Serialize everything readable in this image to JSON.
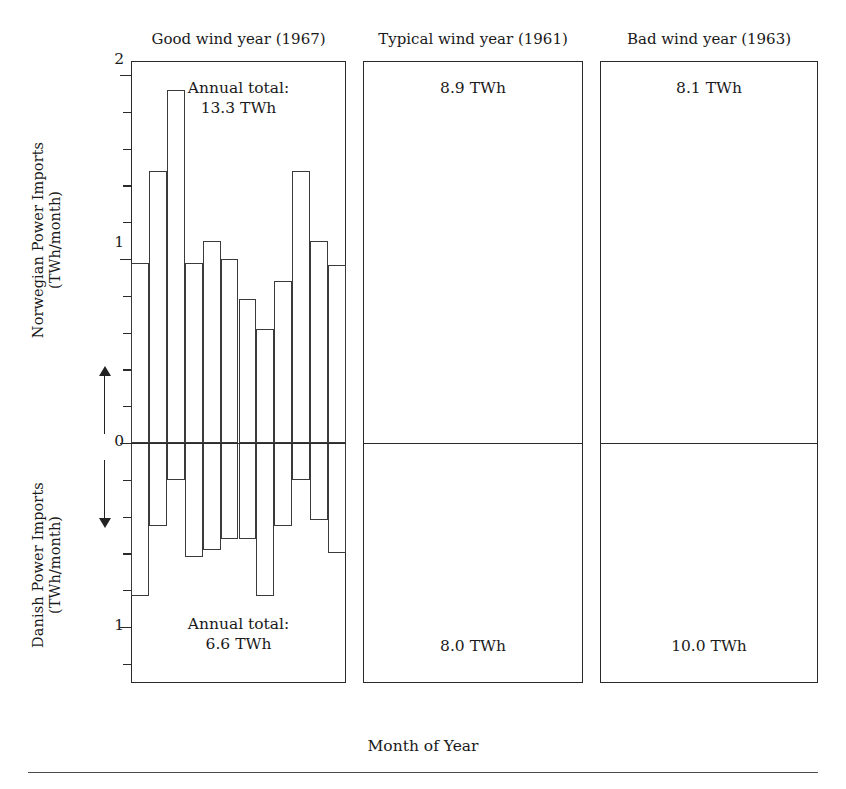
{
  "axes": {
    "ylabel_top_line1": "Norwegian Power Imports",
    "ylabel_top_line2": "(TWh/month)",
    "ylabel_bottom_line1": "Danish Power Imports",
    "ylabel_bottom_line2": "(TWh/month)",
    "xlabel": "Month of Year",
    "ytick_labels": [
      "2",
      "1",
      "0",
      "1"
    ],
    "xtick_labels": [
      "1",
      "4",
      "8",
      "12"
    ],
    "up_arrow": "up-arrow",
    "down_arrow": "down-arrow"
  },
  "panels": [
    {
      "title": "Good wind year (1967)",
      "annotation_top_line1": "Annual total:",
      "annotation_top_line2": "13.3 TWh",
      "annotation_bottom_line1": "Annual total:",
      "annotation_bottom_line2": "6.6 TWh"
    },
    {
      "title": "Typical wind year (1961)",
      "annotation_top_line1": "",
      "annotation_top_line2": "8.9 TWh",
      "annotation_bottom_line1": "",
      "annotation_bottom_line2": "8.0 TWh"
    },
    {
      "title": "Bad wind year (1963)",
      "annotation_top_line1": "",
      "annotation_top_line2": "8.1 TWh",
      "annotation_bottom_line1": "",
      "annotation_bottom_line2": "10.0 TWh"
    }
  ],
  "chart_data": {
    "type": "bar",
    "xlabel": "Month of Year",
    "ylabel_up": "Norwegian Power Imports (TWh/month)",
    "ylabel_down": "Danish Power Imports (TWh/month)",
    "categories": [
      1,
      2,
      3,
      4,
      5,
      6,
      7,
      8,
      9,
      10,
      11,
      12
    ],
    "ylim_up": [
      0,
      2
    ],
    "ylim_down": [
      0,
      1.15
    ],
    "ytick_values_up": [
      0,
      0.2,
      0.4,
      0.6,
      0.8,
      1.0,
      1.2,
      1.4,
      1.6,
      1.8,
      2.0
    ],
    "ytick_values_down": [
      0,
      0.2,
      0.4,
      0.6,
      0.8,
      1.0
    ],
    "ytick_labeled_up": [
      0,
      1,
      2
    ],
    "ytick_labeled_down": [
      1
    ],
    "grid": false,
    "legend": "none",
    "panels": [
      {
        "name": "Good wind year (1967)",
        "year": 1967,
        "annual_total_norwegian_twh": 13.3,
        "annual_total_danish_twh": 6.6,
        "norwegian_imports": [
          0.98,
          1.48,
          1.92,
          0.98,
          1.1,
          1.0,
          0.78,
          0.62,
          0.88,
          1.48,
          1.1,
          0.97
        ],
        "danish_imports": [
          0.83,
          0.45,
          0.2,
          0.62,
          0.58,
          0.52,
          0.52,
          0.83,
          0.45,
          0.2,
          0.42,
          0.6
        ]
      },
      {
        "name": "Typical wind year (1961)",
        "year": 1961,
        "annual_total_norwegian_twh": 8.9,
        "annual_total_danish_twh": 8.0,
        "norwegian_imports": [
          0.68,
          0.58,
          1.3,
          0.77,
          0.52,
          0.45,
          0.57,
          0.5,
          0.6,
          1.25,
          0.82,
          0.88
        ],
        "danish_imports": [
          0.82,
          0.8,
          0.4,
          0.72,
          0.73,
          0.86,
          0.64,
          0.68,
          0.75,
          0.33,
          0.82,
          0.7
        ]
      },
      {
        "name": "Bad wind year (1963)",
        "year": 1963,
        "annual_total_norwegian_twh": 8.1,
        "annual_total_danish_twh": 10.0,
        "norwegian_imports": [
          0.75,
          0.58,
          1.29,
          0.57,
          0.63,
          0.48,
          0.33,
          0.4,
          0.6,
          0.82,
          1.29,
          0.57
        ],
        "danish_imports": [
          0.93,
          0.75,
          0.56,
          0.95,
          0.74,
          0.77,
          0.77,
          0.75,
          0.73,
          0.69,
          0.49,
          1.02
        ]
      }
    ]
  }
}
